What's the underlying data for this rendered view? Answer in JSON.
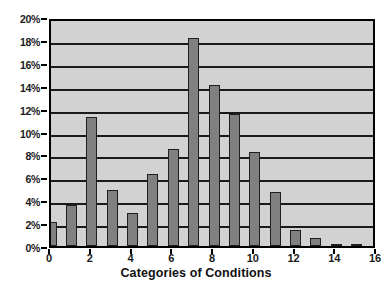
{
  "chart_data": {
    "type": "bar",
    "title": "",
    "xlabel": "Categories of Conditions",
    "ylabel": "",
    "categories": [
      "0",
      "1",
      "2",
      "3",
      "4",
      "5",
      "6",
      "7",
      "8",
      "9",
      "10",
      "11",
      "12",
      "13",
      "14",
      "15"
    ],
    "values": [
      2.1,
      3.6,
      11.3,
      4.85,
      2.85,
      6.25,
      8.5,
      18.2,
      14.05,
      11.5,
      8.2,
      4.7,
      1.4,
      0.7,
      0.1,
      0.2
    ],
    "xlim": [
      0,
      16
    ],
    "ylim": [
      0,
      20
    ],
    "x_tick_labels": [
      "0",
      "2",
      "4",
      "6",
      "8",
      "10",
      "12",
      "14",
      "16"
    ],
    "x_tick_values": [
      0,
      2,
      4,
      6,
      8,
      10,
      12,
      14,
      16
    ],
    "y_tick_labels": [
      "0%",
      "2%",
      "4%",
      "6%",
      "8%",
      "10%",
      "12%",
      "14%",
      "16%",
      "18%",
      "20%"
    ],
    "y_tick_values": [
      0,
      2,
      4,
      6,
      8,
      10,
      12,
      14,
      16,
      18,
      20
    ],
    "grid": true,
    "grid_axis": "y",
    "legend": false,
    "legend_position": "none",
    "colors": {
      "bar_fill": "#808080",
      "bar_border": "#1f1f1f",
      "plot_background": "#d2d2d2",
      "gridline": "#1a1a1a",
      "axis": "#000000",
      "text": "#1a1a1a",
      "page_background": "#ffffff"
    }
  }
}
